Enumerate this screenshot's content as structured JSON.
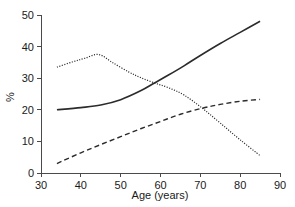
{
  "chart_data": {
    "type": "line",
    "title": "",
    "subtitle": "",
    "xlabel": "Age (years)",
    "ylabel": "%",
    "xlim": [
      30,
      90
    ],
    "ylim": [
      0,
      50
    ],
    "xticks": [
      30,
      40,
      50,
      60,
      70,
      80,
      90
    ],
    "xtick_labels": [
      "30",
      "40",
      "50",
      "60",
      "70",
      "80",
      "90"
    ],
    "yticks": [
      0,
      10,
      20,
      30,
      40,
      50
    ],
    "ytick_labels": [
      "0",
      "10",
      "20",
      "30",
      "40",
      "50"
    ],
    "grid": false,
    "legend": null,
    "legend_position": "none",
    "annotations": [],
    "series": [
      {
        "name": "solid",
        "style": "solid",
        "color": "#2b2b2b",
        "x": [
          34,
          40,
          45,
          50,
          55,
          58.5,
          62,
          66,
          70,
          75,
          80,
          85
        ],
        "values": [
          20.0,
          20.7,
          21.5,
          23.2,
          26.0,
          28.5,
          31.0,
          34.0,
          37.2,
          41.0,
          44.5,
          48.0
        ]
      },
      {
        "name": "dashed",
        "style": "dashed",
        "color": "#2b2b2b",
        "x": [
          34,
          40,
          45,
          50,
          55,
          60,
          65,
          70.5,
          75,
          80,
          85
        ],
        "values": [
          3.0,
          6.4,
          9.0,
          11.5,
          14.0,
          16.3,
          18.6,
          20.5,
          21.7,
          22.7,
          23.3
        ]
      },
      {
        "name": "dotted",
        "style": "dotted",
        "color": "#2b2b2b",
        "x": [
          34,
          38,
          41,
          44.5,
          48,
          52,
          55,
          58.5,
          62,
          66,
          70.5,
          75,
          80,
          85
        ],
        "values": [
          33.5,
          35.2,
          36.3,
          37.5,
          34.9,
          32.0,
          30.2,
          28.5,
          27.0,
          24.6,
          20.5,
          15.8,
          10.5,
          5.5
        ]
      }
    ]
  }
}
